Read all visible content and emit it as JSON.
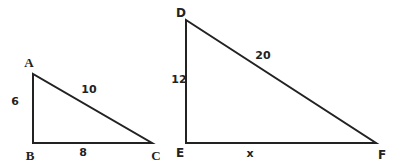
{
  "diagram": {
    "type": "similar-right-triangles",
    "triangles": [
      {
        "name": "ABC",
        "vertices": {
          "A": {
            "label": "A",
            "x": 33,
            "y": 74
          },
          "B": {
            "label": "B",
            "x": 33,
            "y": 143
          },
          "C": {
            "label": "C",
            "x": 152,
            "y": 143
          }
        },
        "right_angle_at": "B",
        "sides": {
          "AB": "6",
          "BC": "8",
          "AC": "10"
        }
      },
      {
        "name": "DEF",
        "vertices": {
          "D": {
            "label": "D",
            "x": 186,
            "y": 20
          },
          "E": {
            "label": "E",
            "x": 186,
            "y": 143
          },
          "F": {
            "label": "F",
            "x": 376,
            "y": 143
          }
        },
        "right_angle_at": "E",
        "sides": {
          "DE": "12",
          "EF": "x",
          "DF": "20"
        }
      }
    ],
    "colors": {
      "stroke": "#222222",
      "background": "#ffffff"
    }
  }
}
